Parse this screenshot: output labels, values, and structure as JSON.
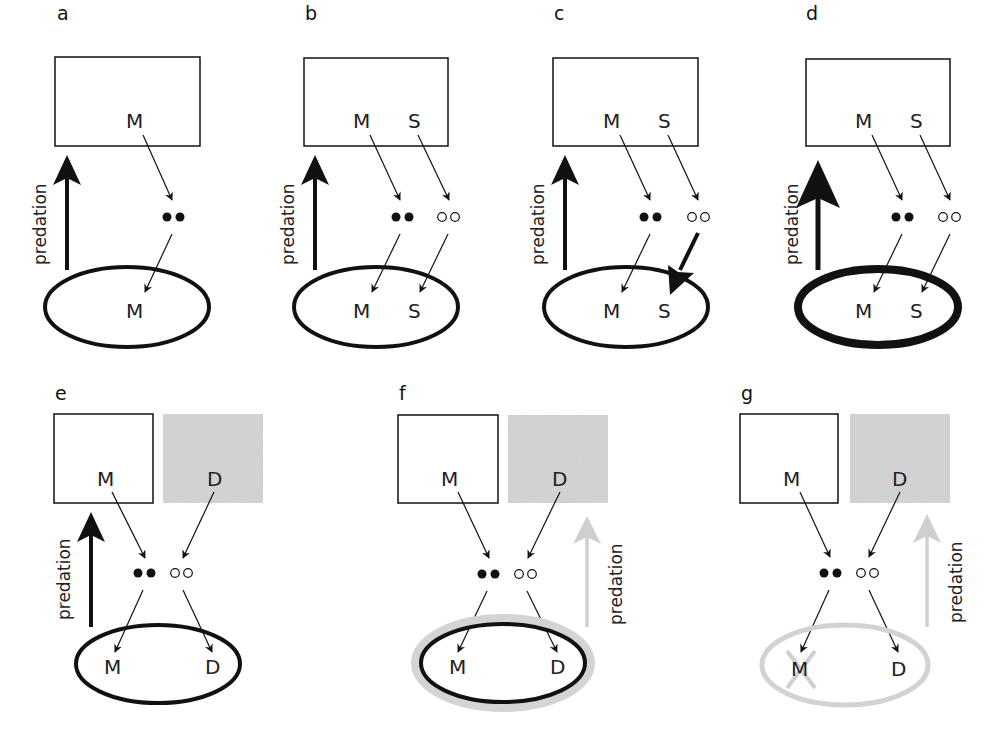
{
  "figure": {
    "type": "ecological-diagram",
    "colors": {
      "stroke": "#111111",
      "faded": "#cfcfcf",
      "shaded_box": "#d6d6d6",
      "background": "#ffffff"
    },
    "predation_label": "predation",
    "panels": [
      {
        "id": "a",
        "label": "a",
        "box_species": [
          "M"
        ],
        "ellipse_species": [
          "M"
        ],
        "predation": "normal",
        "ellipse_weight": "normal"
      },
      {
        "id": "b",
        "label": "b",
        "box_species": [
          "M",
          "S"
        ],
        "ellipse_species": [
          "M",
          "S"
        ],
        "predation": "normal",
        "ellipse_weight": "normal"
      },
      {
        "id": "c",
        "label": "c",
        "box_species": [
          "M",
          "S"
        ],
        "ellipse_species": [
          "M",
          "S"
        ],
        "predation": "normal",
        "ellipse_weight": "normal",
        "emphasis": "thick arrow S to ellipse"
      },
      {
        "id": "d",
        "label": "d",
        "box_species": [
          "M",
          "S"
        ],
        "ellipse_species": [
          "M",
          "S"
        ],
        "predation": "strong",
        "ellipse_weight": "thick"
      },
      {
        "id": "e",
        "label": "e",
        "box_species": [
          "M"
        ],
        "shaded_box_species": [
          "D"
        ],
        "ellipse_species": [
          "M",
          "D"
        ],
        "predation": "normal",
        "ellipse_weight": "normal"
      },
      {
        "id": "f",
        "label": "f",
        "box_species": [
          "M"
        ],
        "shaded_box_species": [
          "D"
        ],
        "ellipse_species": [
          "M",
          "D"
        ],
        "predation": "faded",
        "ellipse_weight": "normal-with-faded-halo"
      },
      {
        "id": "g",
        "label": "g",
        "box_species": [
          "M"
        ],
        "shaded_box_species": [
          "D"
        ],
        "ellipse_species": [
          "M",
          "D"
        ],
        "predation": "faded",
        "ellipse_weight": "faded",
        "crossed_out": "M"
      }
    ]
  },
  "text": {
    "a": "a",
    "b": "b",
    "c": "c",
    "d": "d",
    "e": "e",
    "f": "f",
    "g": "g",
    "M": "M",
    "S": "S",
    "D": "D",
    "predation": "predation"
  }
}
